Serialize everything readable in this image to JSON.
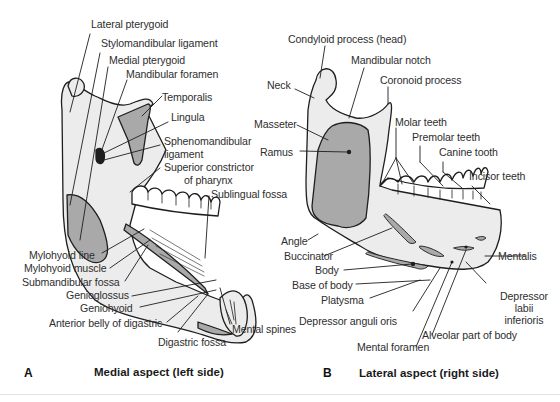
{
  "figure": {
    "colors": {
      "bone_fill": "#ececec",
      "muscle_fill": "#a9a9a9",
      "line": "#1e1e1e",
      "text": "#2e2e2e",
      "background": "#ffffff"
    },
    "panel_a": {
      "letter": "A",
      "caption": "Medial aspect (left side)",
      "labels": {
        "lateral_pterygoid": "Lateral pterygoid",
        "stylomandibular_ligament": "Stylomandibular ligament",
        "medial_pterygoid": "Medial pterygoid",
        "mandibular_foramen": "Mandibular foramen",
        "temporalis": "Temporalis",
        "lingula": "Lingula",
        "sphenomandibular_ligament_1": "Sphenomandibular",
        "sphenomandibular_ligament_2": "ligament",
        "superior_constrictor_1": "Superior constrictor",
        "superior_constrictor_2": "of pharynx",
        "sublingual_fossa": "Sublingual fossa",
        "mylohyoid_line": "Mylohyoid line",
        "mylohyoid_muscle": "Mylohyoid muscle",
        "submandibular_fossa": "Submandibular fossa",
        "genioglossus": "Genioglossus",
        "geniohyoid": "Geniohyoid",
        "anterior_belly_digastric": "Anterior belly of digastric",
        "digastric_fossa": "Digastric fossa",
        "mental_spines": "Mental spines"
      }
    },
    "panel_b": {
      "letter": "B",
      "caption": "Lateral aspect (right side)",
      "labels": {
        "condyloid_process": "Condyloid process (head)",
        "mandibular_notch": "Mandibular notch",
        "neck": "Neck",
        "coronoid_process": "Coronoid process",
        "masseter": "Masseter",
        "ramus": "Ramus",
        "molar_teeth": "Molar teeth",
        "premolar_teeth": "Premolar teeth",
        "canine_tooth": "Canine tooth",
        "incisor_teeth": "Incisor teeth",
        "angle": "Angle",
        "buccinator": "Buccinator",
        "body": "Body",
        "base_of_body": "Base of body",
        "platysma": "Platysma",
        "depressor_anguli_oris": "Depressor anguli oris",
        "mentalis": "Mentalis",
        "depressor_labii_1": "Depressor",
        "depressor_labii_2": "labii",
        "depressor_labii_3": "inferioris",
        "alveolar_part": "Alveolar part of body",
        "mental_foramen": "Mental foramen"
      }
    }
  }
}
